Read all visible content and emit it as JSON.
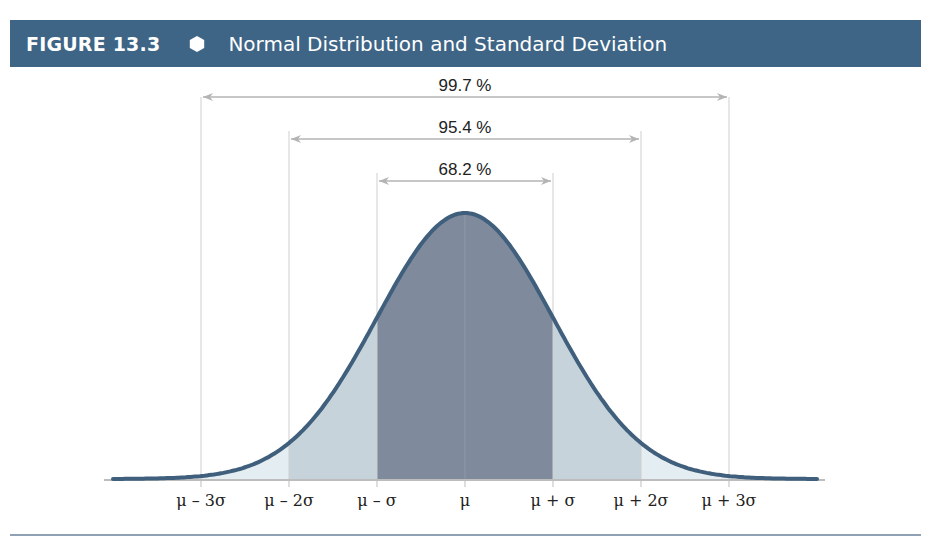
{
  "header": {
    "figure_number": "FIGURE 13.3",
    "title": "Normal Distribution and Standard Deviation"
  },
  "colors": {
    "header_bg": "#3e6586",
    "curve_stroke": "#3f5f7c",
    "fill_1sigma": "#7f8a9c",
    "fill_2sigma": "#c6d3da",
    "fill_3sigma": "#e4edf1",
    "guide_lines": "#cfcfcf",
    "arrows": "#b4b4b4"
  },
  "chart_data": {
    "type": "area",
    "title": "Normal Distribution and Standard Deviation",
    "xlabel": "",
    "ylabel": "",
    "grid": false,
    "legend": null,
    "x_ticks": [
      "μ – 3σ",
      "μ – 2σ",
      "μ – σ",
      "μ",
      "μ + σ",
      "μ + 2σ",
      "μ + 3σ"
    ],
    "x_tick_values": [
      -3,
      -2,
      -1,
      0,
      1,
      2,
      3
    ],
    "xlim": [
      -4,
      4
    ],
    "curve": "standard normal probability density",
    "shaded_regions": [
      {
        "range": [
          -1,
          1
        ],
        "shade": "dark",
        "percent_label": "68.2 %"
      },
      {
        "range": [
          -2,
          2
        ],
        "shade": "medium",
        "percent_label": "95.4 %"
      },
      {
        "range": [
          -3,
          3
        ],
        "shade": "light",
        "percent_label": "99.7 %"
      }
    ],
    "annotations": [
      {
        "text": "99.7 %",
        "from": -3,
        "to": 3
      },
      {
        "text": "95.4 %",
        "from": -2,
        "to": 2
      },
      {
        "text": "68.2 %",
        "from": -1,
        "to": 1
      }
    ]
  }
}
